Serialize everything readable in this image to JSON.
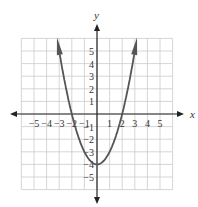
{
  "chart_data": {
    "type": "line",
    "title": "",
    "equation": "y = x^2 - 4",
    "xlabel": "x",
    "ylabel": "y",
    "xlim": [
      -6,
      6
    ],
    "ylim": [
      -6,
      6
    ],
    "grid": true,
    "x_ticks": [
      "-5",
      "-4",
      "-3",
      "-2",
      "-1",
      "1",
      "2",
      "3",
      "4",
      "5"
    ],
    "y_ticks": [
      "5",
      "4",
      "3",
      "2",
      "1",
      "-1",
      "-2",
      "-3",
      "-4",
      "-5"
    ],
    "series": [
      {
        "name": "parabola",
        "x": [
          -3.1,
          -3,
          -2.5,
          -2,
          -1.5,
          -1,
          -0.5,
          0,
          0.5,
          1,
          1.5,
          2,
          2.5,
          3,
          3.1
        ],
        "y": [
          5.61,
          5,
          2.25,
          0,
          -1.75,
          -3,
          -3.75,
          -4,
          -3.75,
          -3,
          -1.75,
          0,
          2.25,
          5,
          5.61
        ]
      }
    ],
    "key_points": {
      "vertex": [
        0,
        -4
      ],
      "x_intercepts": [
        [
          -2,
          0
        ],
        [
          2,
          0
        ]
      ]
    },
    "colors": {
      "curve": "#555555",
      "axes": "#222222",
      "grid": "#cccccc"
    }
  }
}
